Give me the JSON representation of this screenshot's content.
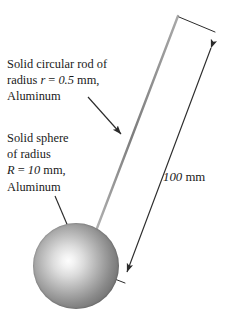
{
  "figure": {
    "background_color": "#ffffff",
    "line_color": "#2b2b2b",
    "rod_color": "#8a8a8a",
    "text_color": "#1a1a1a"
  },
  "rod_label": {
    "line1": "Solid circular rod of",
    "line2_prefix": "radius ",
    "line2_symbol": "r",
    "line2_equals": " = ",
    "line2_value": "0.5",
    "line2_unit": " mm,",
    "line3": "Aluminum"
  },
  "sphere_label": {
    "line1": "Solid sphere",
    "line2": "of radius",
    "line3_symbol": "R",
    "line3_equals": " = ",
    "line3_value": "10",
    "line3_unit": " mm,",
    "line4": "Aluminum"
  },
  "dimension": {
    "value": "100",
    "unit": " mm"
  },
  "geometry": {
    "sphere_center_x": 76,
    "sphere_center_y": 266,
    "sphere_radius_px": 43,
    "rod_top_x": 178,
    "rod_top_y": 16,
    "rod_bottom_x": 94,
    "rod_bottom_y": 234
  }
}
